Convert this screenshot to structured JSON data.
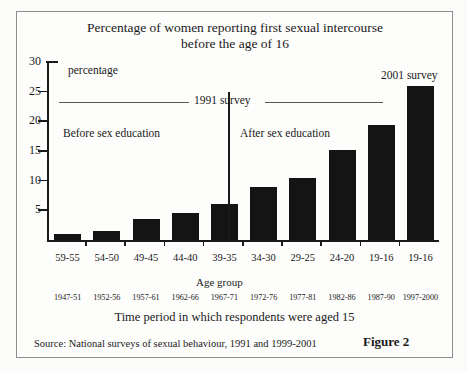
{
  "figure": {
    "title_line1": "Percentage of women reporting first sexual intercourse",
    "title_line2": "before the age of 16",
    "figure_label": "Figure 2",
    "source": "Source: National surveys of sexual behaviour, 1991 and 1999-2001",
    "y_axis_note": "percentage",
    "x_axis_label": "Age group",
    "time_caption": "Time period in which respondents were aged 15",
    "annotations": {
      "survey_1991": "1991 survey",
      "survey_2001": "2001 survey",
      "before_education": "Before sex education",
      "after_education": "After sex education"
    }
  },
  "chart_data": {
    "type": "bar",
    "title": "Percentage of women reporting first sexual intercourse before the age of 16",
    "xlabel": "Age group",
    "ylabel": "percentage",
    "ylim": [
      0,
      30
    ],
    "yticks": [
      0,
      5,
      10,
      15,
      20,
      25,
      30
    ],
    "ytick_labels": [
      "",
      "5",
      "10",
      "15",
      "20",
      "25",
      "30"
    ],
    "grid": false,
    "legend": "none",
    "categories": [
      "59-55",
      "54-50",
      "49-45",
      "44-40",
      "39-35",
      "34-30",
      "29-25",
      "24-20",
      "19-16",
      "19-16"
    ],
    "secondary_categories": [
      "1947-51",
      "1952-56",
      "1957-61",
      "1962-66",
      "1967-71",
      "1972-76",
      "1977-81",
      "1982-86",
      "1987-90",
      "1997-2000"
    ],
    "values": [
      1.0,
      1.5,
      3.6,
      4.6,
      6.1,
      8.9,
      10.4,
      15.2,
      19.3,
      26.0
    ],
    "bar_color": "#141414",
    "groups": [
      {
        "name": "Before sex education",
        "categories": [
          "59-55",
          "54-50",
          "49-45",
          "44-40"
        ]
      },
      {
        "name": "After sex education",
        "categories": [
          "39-35",
          "34-30",
          "29-25",
          "24-20",
          "19-16"
        ]
      },
      {
        "name": "2001 survey",
        "categories": [
          "19-16"
        ]
      }
    ]
  }
}
